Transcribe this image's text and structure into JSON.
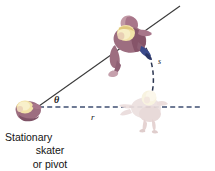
{
  "figure": {
    "background_color": "#ffffff",
    "width": 215,
    "height": 171
  },
  "caption": {
    "line1": "Stationary",
    "line2": "skater",
    "line3": "or pivot"
  },
  "labels": {
    "theta": "θ",
    "radius": "r",
    "arc": "s"
  },
  "colors": {
    "radius_line": "#3a4a6b",
    "arc_line": "#2b3550",
    "solid_line": "#3a3a3a",
    "skater_body": "#9d6e80",
    "skater_body_shade": "#7e5266",
    "skater_hair": "#f2e2a8",
    "skater_hair_shade": "#e0c87e",
    "skate_accent": "#2f3f7a",
    "ghost_body": "#e8d9da",
    "ghost_hair": "#f7f0dc",
    "text": "#141414"
  },
  "geometry": {
    "pivot": {
      "x": 38,
      "y": 107
    },
    "solid_line_end": {
      "x": 180,
      "y": 6
    },
    "dashed_radius_end": {
      "x": 201,
      "y": 107
    },
    "angle_degrees": 35,
    "arc_start": {
      "x": 142,
      "y": 41
    },
    "arc_end": {
      "x": 152,
      "y": 93
    }
  },
  "elements": {
    "rotating_skater": "rotating-skater-figure",
    "ghost_skater": "initial-position-skater-figure",
    "pivot_skater": "pivot-skater-figure",
    "radius_line": "radius-dashed-line",
    "arc_line": "arc-length-dashed-curve",
    "rotation_line": "rotation-solid-line"
  }
}
